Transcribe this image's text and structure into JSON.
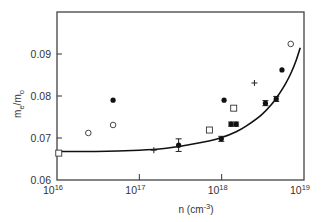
{
  "chart_data": {
    "type": "scatter",
    "title": "",
    "xlabel": {
      "base": "n (cm",
      "sup": "-3",
      "tail": ")"
    },
    "ylabel": {
      "main": "m",
      "sub1": "e",
      "slash": "/m",
      "sub2": "o"
    },
    "xscale": "log",
    "xlim": [
      1e+16,
      1e+19
    ],
    "ylim": [
      0.06,
      0.1
    ],
    "xticks": [
      {
        "value": 1e+16,
        "base": "10",
        "exp": "16"
      },
      {
        "value": 1e+17,
        "base": "10",
        "exp": "17"
      },
      {
        "value": 1e+18,
        "base": "10",
        "exp": "18"
      },
      {
        "value": 1e+19,
        "base": "10",
        "exp": "19"
      }
    ],
    "yticks": [
      {
        "value": 0.06,
        "label": "0.06"
      },
      {
        "value": 0.07,
        "label": "0.07"
      },
      {
        "value": 0.08,
        "label": "0.08"
      },
      {
        "value": 0.09,
        "label": "0.09"
      }
    ],
    "grid": false,
    "legend": null,
    "series": [
      {
        "name": "filled-circles",
        "marker": "filled-circle",
        "points": [
          {
            "x": 4.8e+16,
            "y": 0.079
          },
          {
            "x": 3e+17,
            "y": 0.0683,
            "err": 0.0015
          },
          {
            "x": 9.9e+17,
            "y": 0.0698,
            "err": 0.0006
          },
          {
            "x": 1.07e+18,
            "y": 0.079
          },
          {
            "x": 1.3e+18,
            "y": 0.0733,
            "err": 0.0005
          },
          {
            "x": 1.5e+18,
            "y": 0.0733,
            "err": 0.0005
          },
          {
            "x": 3.4e+18,
            "y": 0.0783,
            "err": 0.0006
          },
          {
            "x": 4.6e+18,
            "y": 0.0793,
            "err": 0.0006
          },
          {
            "x": 5.4e+18,
            "y": 0.0862
          }
        ]
      },
      {
        "name": "open-circles",
        "marker": "open-circle",
        "points": [
          {
            "x": 2.4e+16,
            "y": 0.0712
          },
          {
            "x": 4.8e+16,
            "y": 0.0731
          },
          {
            "x": 6.9e+18,
            "y": 0.0924
          }
        ]
      },
      {
        "name": "open-squares",
        "marker": "open-square",
        "points": [
          {
            "x": 1.05e+16,
            "y": 0.0664
          },
          {
            "x": 7.1e+17,
            "y": 0.0719
          },
          {
            "x": 1.4e+18,
            "y": 0.0771
          }
        ]
      },
      {
        "name": "crosses",
        "marker": "plus",
        "points": [
          {
            "x": 1.5e+17,
            "y": 0.0671
          },
          {
            "x": 2.5e+18,
            "y": 0.0831
          }
        ]
      }
    ],
    "curve": {
      "name": "theory-curve",
      "points": [
        {
          "x": 1e+16,
          "y": 0.0668
        },
        {
          "x": 3e+16,
          "y": 0.0668
        },
        {
          "x": 1e+17,
          "y": 0.0671
        },
        {
          "x": 2e+17,
          "y": 0.0675
        },
        {
          "x": 4e+17,
          "y": 0.0684
        },
        {
          "x": 7e+17,
          "y": 0.0693
        },
        {
          "x": 1e+18,
          "y": 0.0701
        },
        {
          "x": 1.5e+18,
          "y": 0.0715
        },
        {
          "x": 2e+18,
          "y": 0.0729
        },
        {
          "x": 3e+18,
          "y": 0.0754
        },
        {
          "x": 4e+18,
          "y": 0.0779
        },
        {
          "x": 5e+18,
          "y": 0.0805
        },
        {
          "x": 6e+18,
          "y": 0.083
        },
        {
          "x": 7e+18,
          "y": 0.0856
        },
        {
          "x": 8e+18,
          "y": 0.0884
        },
        {
          "x": 9e+18,
          "y": 0.0915
        }
      ]
    }
  }
}
